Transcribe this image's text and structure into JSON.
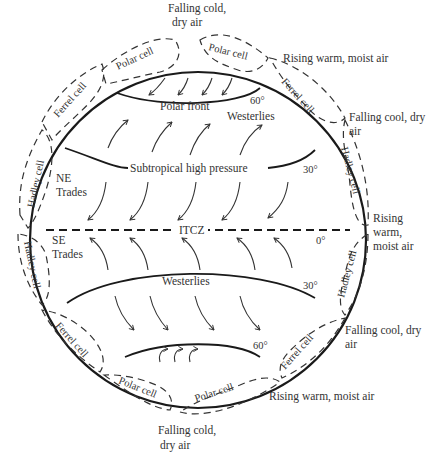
{
  "diagram": {
    "latitude_labels": {
      "north_60": "60°",
      "north_30": "30°",
      "equator": "0°",
      "south_30": "30°",
      "south_60": "60°"
    },
    "interior_labels": {
      "polar_front": "Polar front",
      "westerlies_north": "Westerlies",
      "subtropical_high": "Subtropical high pressure",
      "ne_trades_line1": "NE",
      "ne_trades_line2": "Trades",
      "itcz": "ITCZ",
      "se_trades_line1": "SE",
      "se_trades_line2": "Trades",
      "westerlies_south": "Westerlies"
    },
    "cells": {
      "polar_nw": "Polar cell",
      "polar_ne": "Polar cell",
      "ferrel_nw": "Ferrel cell",
      "ferrel_ne": "Ferrel cell",
      "hadley_nw": "Hadley cell",
      "hadley_ne": "Hadley cell",
      "hadley_sw": "Hadley cell",
      "hadley_se": "Hadley cell",
      "ferrel_sw": "Ferrel cell",
      "ferrel_se": "Ferrel cell",
      "polar_sw": "Polar cell",
      "polar_se": "Polar cell"
    },
    "air_annotations": {
      "top_falling_line1": "Falling cold,",
      "top_falling_line2": "dry air",
      "ne_rising": "Rising warm, moist air",
      "ne_falling_line1": "Falling cool, dry",
      "ne_falling_line2": "air",
      "eq_rising_line1": "Rising",
      "eq_rising_line2": "warm,",
      "eq_rising_line3": "moist air",
      "se_falling_line1": "Falling cool, dry",
      "se_falling_line2": "air",
      "se_rising": "Rising warm, moist air",
      "bottom_falling_line1": "Falling cold,",
      "bottom_falling_line2": "dry air"
    }
  }
}
